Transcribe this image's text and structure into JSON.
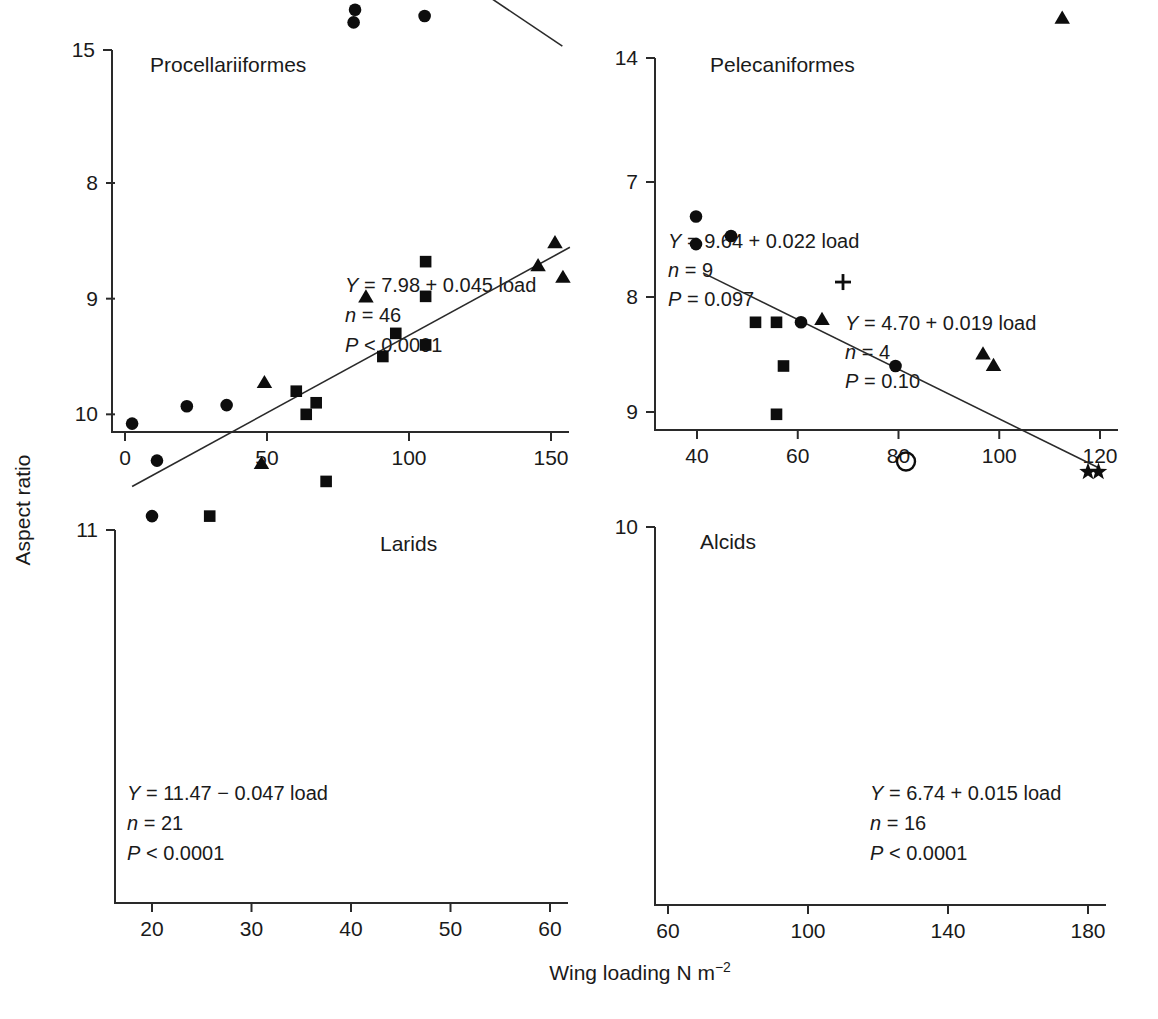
{
  "figure": {
    "x_axis_label_main": "Wing loading N m",
    "x_axis_label_exp": "−2",
    "y_axis_label": "Aspect ratio"
  },
  "chart_data": [
    {
      "type": "scatter",
      "title": "Procellariiformes",
      "xlabel": "Wing loading N m-2",
      "ylabel": "Aspect ratio",
      "xlim": [
        -5,
        160
      ],
      "ylim": [
        5.6,
        15.3
      ],
      "xticks": [
        0,
        50,
        100,
        150
      ],
      "xtick_labels": [
        "0",
        "50",
        "100",
        "150"
      ],
      "yticks": [
        6,
        9,
        12,
        15
      ],
      "ytick_labels": [
        "6",
        "9",
        "12",
        "15"
      ],
      "grid": false,
      "legend": "none",
      "annotation": {
        "equation_sym": "Y",
        "equation_rest": " = 7.98 + 0.045 load",
        "n_sym": "n",
        "n_rest": " = 46",
        "p_sym": "P",
        "p_rest": " < 0.0001"
      },
      "fit": {
        "intercept": 7.98,
        "slope": 0.045,
        "x_start": 12,
        "x_end": 154
      },
      "series": [
        {
          "name": "circle",
          "marker": "filled-circle",
          "points": [
            [
              12.5,
              7.75
            ],
            [
              14.5,
              7.78
            ],
            [
              17.0,
              7.75
            ],
            [
              15.5,
              7.15
            ],
            [
              17.5,
              7.12
            ],
            [
              19.5,
              7.13
            ],
            [
              21.0,
              7.12
            ],
            [
              18.5,
              6.45
            ],
            [
              18.0,
              9.35
            ],
            [
              19.5,
              9.78
            ],
            [
              21.5,
              9.75
            ],
            [
              23.5,
              9.8
            ],
            [
              22.5,
              10.05
            ],
            [
              24.5,
              10.02
            ],
            [
              25.5,
              9.78
            ],
            [
              26.5,
              9.8
            ],
            [
              27.5,
              10.05
            ],
            [
              28.5,
              10.0
            ],
            [
              24.0,
              11.1
            ],
            [
              26.5,
              11.1
            ],
            [
              31.0,
              8.65
            ],
            [
              32.5,
              8.8
            ],
            [
              30.5,
              11.1
            ],
            [
              33.0,
              10.95
            ],
            [
              32.0,
              10.45
            ],
            [
              33.0,
              10.3
            ],
            [
              34.5,
              10.05
            ],
            [
              35.5,
              10.65
            ],
            [
              36.5,
              10.6
            ],
            [
              36.0,
              9.55
            ],
            [
              38.0,
              11.85
            ],
            [
              41.5,
              10.6
            ],
            [
              41.0,
              9.95
            ],
            [
              44.5,
              9.6
            ],
            [
              45.0,
              10.05
            ],
            [
              47.5,
              10.0
            ],
            [
              46.5,
              11.5
            ],
            [
              54.0,
              10.3
            ],
            [
              55.5,
              11.25
            ],
            [
              54.0,
              9.6
            ],
            [
              58.5,
              9.8
            ],
            [
              60.5,
              9.75
            ],
            [
              62.5,
              9.6
            ],
            [
              55.5,
              7.3
            ],
            [
              64.5,
              11.25
            ],
            [
              66.5,
              8.1
            ],
            [
              74.5,
              10.65
            ],
            [
              78.0,
              11.7
            ],
            [
              80.5,
              14.35
            ],
            [
              81.0,
              14.05
            ],
            [
              86.5,
              11.7
            ],
            [
              100.5,
              12.55
            ],
            [
              101.0,
              13.0
            ],
            [
              104.5,
              12.8
            ],
            [
              104.0,
              13.5
            ],
            [
              105.5,
              14.2
            ],
            [
              154.0,
              12.05
            ]
          ]
        }
      ]
    },
    {
      "type": "scatter",
      "title": "Pelecaniformes",
      "xlabel": "Wing loading N m-2",
      "ylabel": "Aspect ratio",
      "xlim": [
        31,
        124
      ],
      "ylim": [
        5.7,
        14.3
      ],
      "xticks": [
        40,
        60,
        80,
        100,
        120
      ],
      "xtick_labels": [
        "40",
        "60",
        "80",
        "100",
        "120"
      ],
      "yticks": [
        6,
        8,
        10,
        12,
        14
      ],
      "ytick_labels": [
        "6",
        "8",
        "10",
        "12",
        "14"
      ],
      "grid": false,
      "legend": "none",
      "annotation": {
        "equation_sym": "Y",
        "equation_rest": " = 9.64 + 0.022 load",
        "n_sym": "n",
        "n_rest": " = 9",
        "p_sym": "P",
        "p_rest": " = 0.097"
      },
      "annotation2": {
        "equation_sym": "Y",
        "equation_rest": " = 4.70 + 0.019 load",
        "n_sym": "n",
        "n_rest": " = 4",
        "p_sym": "P",
        "p_rest": " = 0.10"
      },
      "series": [
        {
          "name": "triangle",
          "marker": "filled-triangle",
          "points": [
            [
              54.0,
              11.1
            ],
            [
              64.5,
              11.4
            ],
            [
              65.0,
              10.95
            ],
            [
              78.5,
              11.4
            ],
            [
              112.5,
              13.1
            ]
          ]
        },
        {
          "name": "square",
          "marker": "filled-square",
          "points": [
            [
              55.5,
              10.7
            ],
            [
              60.0,
              10.45
            ]
          ]
        },
        {
          "name": "star",
          "marker": "filled-star",
          "points": [
            [
              33.5,
              11.1
            ]
          ]
        },
        {
          "name": "plus",
          "marker": "plus",
          "points": [
            [
              82.5,
              10.05
            ]
          ]
        },
        {
          "name": "circle",
          "marker": "filled-circle",
          "points": [
            [
              79.0,
              6.1
            ],
            [
              98.0,
              6.2
            ],
            [
              112.5,
              6.85
            ],
            [
              120.0,
              6.85
            ]
          ]
        }
      ]
    },
    {
      "type": "scatter",
      "title": "Larids",
      "xlabel": "Wing loading N m-2",
      "ylabel": "Aspect ratio",
      "xlim": [
        16.5,
        63
      ],
      "ylim": [
        7.9,
        11.1
      ],
      "xticks": [
        20,
        30,
        40,
        50,
        60
      ],
      "xtick_labels": [
        "20",
        "30",
        "40",
        "50",
        "60"
      ],
      "yticks": [
        8,
        9,
        10,
        11
      ],
      "ytick_labels": [
        "8",
        "9",
        "10",
        "11"
      ],
      "grid": false,
      "legend": "none",
      "annotation": {
        "equation_sym": "Y",
        "equation_rest": " = 11.47 − 0.047 load",
        "n_sym": "n",
        "n_rest": " = 21",
        "p_sym": "P",
        "p_rest": " < 0.0001"
      },
      "fit": {
        "intercept": 11.47,
        "slope": -0.047,
        "x_start": 18,
        "x_end": 62
      },
      "series": [
        {
          "name": "circle",
          "marker": "filled-circle",
          "points": [
            [
              20.0,
              10.88
            ],
            [
              20.5,
              10.4
            ],
            [
              18.0,
              10.08
            ],
            [
              23.5,
              9.93
            ],
            [
              27.5,
              9.92
            ]
          ]
        },
        {
          "name": "square",
          "marker": "filled-square",
          "points": [
            [
              25.8,
              10.88
            ],
            [
              37.5,
              10.58
            ],
            [
              35.5,
              10.0
            ],
            [
              36.5,
              9.9
            ],
            [
              34.5,
              9.8
            ],
            [
              43.2,
              9.5
            ],
            [
              44.5,
              9.3
            ],
            [
              47.5,
              9.4
            ],
            [
              47.5,
              8.98
            ],
            [
              47.5,
              8.68
            ]
          ]
        },
        {
          "name": "triangle",
          "marker": "filled-triangle",
          "points": [
            [
              31.0,
              10.43
            ],
            [
              31.3,
              9.73
            ],
            [
              41.5,
              8.99
            ],
            [
              58.8,
              8.72
            ],
            [
              61.3,
              8.82
            ],
            [
              60.5,
              8.52
            ]
          ]
        }
      ]
    },
    {
      "type": "scatter",
      "title": "Alcids",
      "xlabel": "Wing loading N m-2",
      "ylabel": "Aspect ratio",
      "xlim": [
        57,
        187
      ],
      "ylim": [
        6.9,
        10.1
      ],
      "xticks": [
        60,
        100,
        140,
        180
      ],
      "xtick_labels": [
        "60",
        "100",
        "140",
        "180"
      ],
      "yticks": [
        7,
        8,
        9,
        10
      ],
      "ytick_labels": [
        "7",
        "8",
        "9",
        "10"
      ],
      "grid": false,
      "legend": "none",
      "annotation": {
        "equation_sym": "Y",
        "equation_rest": " = 6.74 + 0.015 load",
        "n_sym": "n",
        "n_rest": " = 16",
        "p_sym": "P",
        "p_rest": " < 0.0001"
      },
      "fit": {
        "intercept": 6.74,
        "slope": 0.015,
        "x_start": 70,
        "x_end": 183
      },
      "series": [
        {
          "name": "square",
          "marker": "filled-square",
          "points": [
            [
              91.0,
              9.02
            ],
            [
              93.0,
              8.6
            ],
            [
              85.0,
              8.22
            ],
            [
              91.0,
              8.22
            ]
          ]
        },
        {
          "name": "circle",
          "marker": "filled-circle",
          "points": [
            [
              98.0,
              8.22
            ],
            [
              125.0,
              8.6
            ],
            [
              68.0,
              7.54
            ],
            [
              68.0,
              7.3
            ],
            [
              78.0,
              7.47
            ]
          ]
        },
        {
          "name": "triangle",
          "marker": "filled-triangle",
          "points": [
            [
              104.0,
              8.2
            ],
            [
              150.0,
              8.5
            ],
            [
              153.0,
              8.6
            ]
          ]
        },
        {
          "name": "open-circle",
          "marker": "open-circle",
          "points": [
            [
              128.0,
              9.43
            ]
          ]
        },
        {
          "name": "plus",
          "marker": "plus",
          "points": [
            [
              110.0,
              7.87
            ]
          ]
        },
        {
          "name": "star",
          "marker": "filled-star",
          "points": [
            [
              180.0,
              9.52
            ],
            [
              183.0,
              9.52
            ]
          ]
        }
      ]
    }
  ]
}
